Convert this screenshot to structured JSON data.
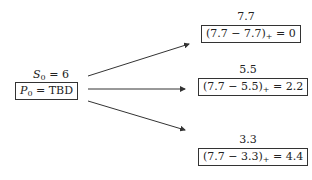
{
  "root": {
    "price_label": "S₀ = 6",
    "price_var": "S",
    "price_sub": "0",
    "price_value": "= 6",
    "payoff_var": "P",
    "payoff_sub": "0",
    "payoff_value": "= TBD"
  },
  "branches": [
    {
      "price": "7.7",
      "formula": "(7.7 − 7.7)",
      "plus": "+",
      "result": "= 0"
    },
    {
      "price": "5.5",
      "formula": "(7.7 − 5.5)",
      "plus": "+",
      "result": "= 2.2"
    },
    {
      "price": "3.3",
      "formula": "(7.7 − 3.3)",
      "plus": "+",
      "result": "= 4.4"
    }
  ]
}
